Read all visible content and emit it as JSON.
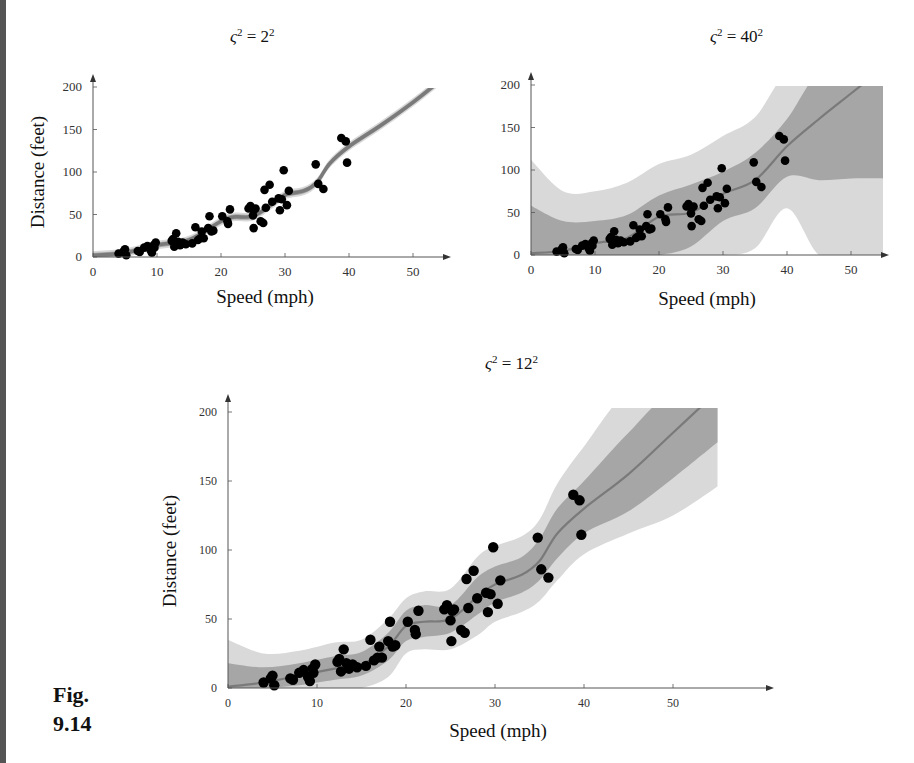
{
  "figure": {
    "label_line1": "Fig.",
    "label_line2": "9.14"
  },
  "colors": {
    "outer_band": "#d9d9d9",
    "inner_band": "#a6a6a6",
    "mean_line": "#7a7a7a",
    "points": "#000000",
    "axis": "#555555"
  },
  "chart_data": [
    {
      "type": "scatter",
      "title": "ς² = 2²",
      "title_base": "ς",
      "title_exp1": "2",
      "title_eq": " = 2",
      "title_exp2": "2",
      "xlabel": "Speed (mph)",
      "ylabel": "Distance (feet)",
      "xlim": [
        0,
        55
      ],
      "ylim": [
        0,
        210
      ],
      "xticks": [
        0,
        10,
        20,
        30,
        40,
        50
      ],
      "yticks": [
        0,
        50,
        100,
        150,
        200
      ],
      "mean_x": [
        0,
        5,
        10,
        15,
        20,
        22,
        25,
        28,
        30,
        33,
        35,
        37,
        40,
        45,
        50,
        55
      ],
      "mean_y": [
        2,
        5,
        14,
        20,
        42,
        47,
        48,
        62,
        73,
        78,
        88,
        110,
        130,
        155,
        182,
        212
      ],
      "band_inner_halfwidth": [
        3,
        3,
        3,
        3,
        3,
        3,
        3,
        3,
        3,
        3,
        3,
        3,
        3,
        3,
        3,
        3
      ],
      "band_outer_halfwidth": [
        5,
        5,
        5,
        5,
        5,
        5,
        5,
        5,
        5,
        5,
        5,
        5,
        5,
        5,
        5,
        5
      ]
    },
    {
      "type": "scatter",
      "title": "ς² = 40²",
      "title_base": "ς",
      "title_exp1": "2",
      "title_eq": " = 40",
      "title_exp2": "2",
      "xlabel": "Speed (mph)",
      "ylabel": "",
      "xlim": [
        0,
        55
      ],
      "ylim": [
        0,
        210
      ],
      "xticks": [
        0,
        10,
        20,
        30,
        40,
        50
      ],
      "yticks": [
        0,
        50,
        100,
        150,
        200
      ],
      "mean_x": [
        0,
        5,
        10,
        15,
        20,
        25,
        30,
        35,
        40,
        45,
        50,
        55
      ],
      "mean_y": [
        2,
        5,
        14,
        20,
        45,
        50,
        72,
        88,
        128,
        160,
        190,
        220
      ],
      "band_inner_upper": [
        58,
        40,
        40,
        47,
        70,
        83,
        98,
        120,
        160,
        215,
        215,
        215
      ],
      "band_inner_lower": [
        0,
        0,
        0,
        0,
        0,
        10,
        40,
        55,
        92,
        88,
        90,
        90
      ],
      "band_outer_upper": [
        112,
        75,
        75,
        85,
        107,
        118,
        140,
        162,
        215,
        215,
        215,
        215
      ],
      "band_outer_lower": [
        0,
        0,
        0,
        0,
        0,
        0,
        0,
        8,
        55,
        0,
        0,
        0
      ]
    },
    {
      "type": "scatter",
      "title": "ς² = 12²",
      "title_base": "ς",
      "title_exp1": "2",
      "title_eq": " = 12",
      "title_exp2": "2",
      "xlabel": "Speed (mph)",
      "ylabel": "Distance (feet)",
      "xlim": [
        0,
        55
      ],
      "ylim": [
        0,
        210
      ],
      "xticks": [
        0,
        10,
        20,
        30,
        40,
        50
      ],
      "yticks": [
        0,
        50,
        100,
        150,
        200
      ],
      "mean_x": [
        0,
        4,
        8,
        12,
        15,
        18,
        20,
        22,
        25,
        28,
        30,
        33,
        35,
        37,
        40,
        45,
        50,
        55
      ],
      "mean_y": [
        1,
        4,
        9,
        14,
        17,
        30,
        45,
        48,
        50,
        66,
        75,
        82,
        92,
        112,
        130,
        155,
        185,
        215
      ],
      "band_inner_upper": [
        18,
        15,
        18,
        23,
        26,
        40,
        56,
        60,
        60,
        80,
        88,
        95,
        108,
        130,
        150,
        185,
        215,
        215
      ],
      "band_inner_lower": [
        0,
        0,
        2,
        6,
        9,
        20,
        34,
        37,
        40,
        53,
        62,
        69,
        78,
        94,
        112,
        128,
        152,
        178
      ],
      "band_outer_upper": [
        35,
        25,
        27,
        33,
        35,
        50,
        65,
        70,
        72,
        95,
        103,
        110,
        122,
        148,
        175,
        215,
        215,
        215
      ],
      "band_outer_lower": [
        0,
        0,
        0,
        0,
        0,
        8,
        25,
        28,
        28,
        38,
        48,
        55,
        63,
        78,
        97,
        112,
        125,
        146
      ]
    }
  ],
  "points": {
    "speed": [
      4,
      4,
      7,
      7,
      8,
      9,
      10,
      10,
      10,
      11,
      11,
      12,
      12,
      12,
      12,
      13,
      13,
      13,
      13,
      14,
      14,
      14,
      14,
      15,
      15,
      15,
      16,
      16,
      17,
      17,
      17,
      18,
      18,
      18,
      18,
      19,
      19,
      19,
      20,
      20,
      20,
      20,
      20,
      22,
      23,
      24,
      24,
      24,
      24,
      25
    ],
    "dist": [
      2,
      10,
      4,
      22,
      16,
      10,
      18,
      26,
      34,
      17,
      28,
      14,
      20,
      24,
      28,
      26,
      34,
      34,
      46,
      26,
      36,
      60,
      80,
      20,
      26,
      54,
      32,
      40,
      32,
      40,
      50,
      42,
      56,
      76,
      84,
      36,
      46,
      68,
      32,
      48,
      52,
      56,
      64,
      66,
      54,
      70,
      92,
      93,
      120,
      85
    ]
  },
  "points_plotted_note": "",
  "plotted_points": {
    "x": [
      4,
      4.8,
      5,
      5.2,
      7,
      7.3,
      8,
      8.5,
      9,
      9.2,
      9.5,
      9.6,
      9.8,
      12.3,
      12.5,
      12.7,
      13,
      13.3,
      13.6,
      14,
      14.5,
      15.5,
      16,
      16.4,
      16.8,
      17,
      17.3,
      18,
      18.2,
      18.5,
      18.8,
      20.2,
      21,
      21.1,
      21.4,
      24.3,
      24.6,
      25,
      25.1,
      25.2,
      25.4,
      26.2,
      26.6,
      26.8,
      27,
      27.6,
      28,
      29,
      29.2,
      29.5,
      29.8,
      30.3,
      30.6,
      34.8,
      35.2,
      36,
      38.8,
      39.5,
      39.7
    ],
    "y": [
      4,
      7,
      9,
      2,
      7,
      6,
      11,
      13,
      8,
      5,
      14,
      11,
      17,
      19,
      21,
      12,
      28,
      18,
      14,
      17,
      15,
      16,
      35,
      20,
      22,
      30,
      22,
      34,
      48,
      30,
      31,
      48,
      42,
      39,
      56,
      57,
      60,
      49,
      34,
      56,
      57,
      42,
      40,
      79,
      58,
      85,
      65,
      69,
      55,
      68,
      102,
      61,
      78,
      109,
      86,
      80,
      140,
      136,
      111
    ]
  }
}
